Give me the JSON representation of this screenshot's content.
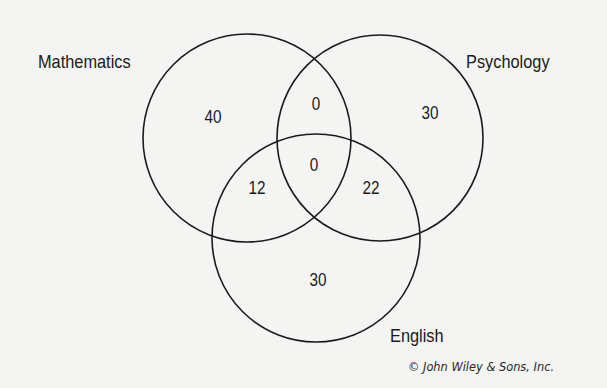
{
  "diagram": {
    "type": "venn-3",
    "sets": [
      {
        "name": "Mathematics",
        "only": 40
      },
      {
        "name": "Psychology",
        "only": 30
      },
      {
        "name": "English",
        "only": 30
      }
    ],
    "regions": {
      "mathematics_only": "40",
      "psychology_only": "30",
      "english_only": "30",
      "mathematics_psychology": "0",
      "mathematics_english": "12",
      "psychology_english": "22",
      "all_three": "0"
    },
    "labels": {
      "mathematics": "Mathematics",
      "psychology": "Psychology",
      "english": "English"
    },
    "credit": "© John Wiley & Sons, Inc.",
    "stroke_color": "#1b1b1b",
    "background_color": "#f4f4f2"
  }
}
